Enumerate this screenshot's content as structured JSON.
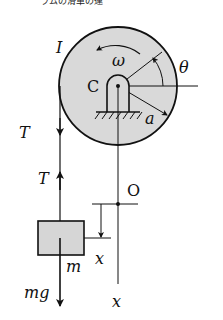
{
  "figure": {
    "top_caption_fragment": "ラムの滑車の運",
    "colors": {
      "ink": "#111111",
      "disk_fill": "#d9d9d9",
      "block_fill": "#d6d6d6",
      "background": "#ffffff"
    },
    "pulley": {
      "moment_of_inertia_label": "I",
      "center_label": "C",
      "angular_velocity_label": "ω",
      "angle_label": "θ",
      "radius_label": "a"
    },
    "rope": {
      "tension_upper_label": "T",
      "tension_lower_label": "T"
    },
    "block": {
      "mass_label": "m",
      "weight_label": "mg"
    },
    "axis": {
      "origin_label": "O",
      "displacement_label": "x",
      "axis_label": "x"
    }
  }
}
